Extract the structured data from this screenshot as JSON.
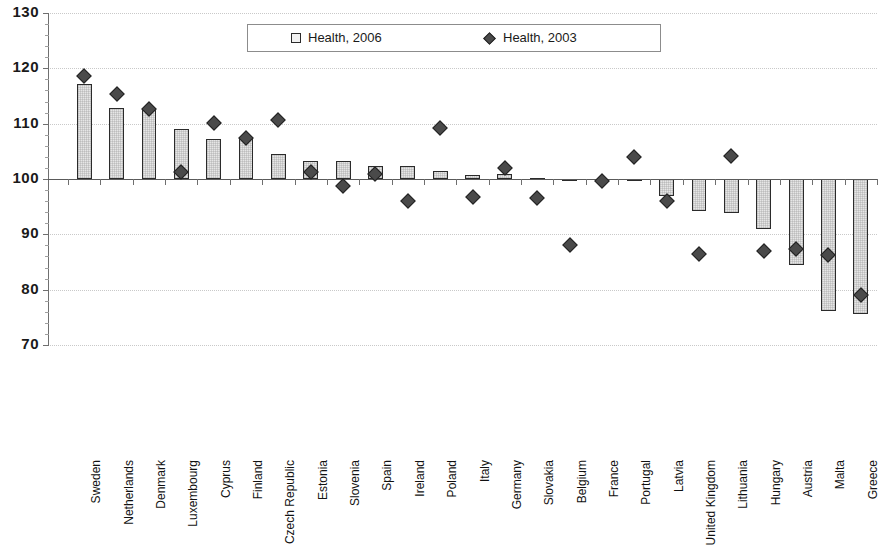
{
  "chart_data": {
    "type": "bar",
    "title": "",
    "xlabel": "",
    "ylabel": "",
    "ylim": [
      70,
      130
    ],
    "ytick_step": 10,
    "yticks": [
      70,
      80,
      90,
      100,
      110,
      120,
      130
    ],
    "grid": true,
    "baseline": 100,
    "legend_position": "top-center",
    "categories": [
      "Sweden",
      "Netherlands",
      "Denmark",
      "Luxembourg",
      "Cyprus",
      "Finland",
      "Czech Republic",
      "Estonia",
      "Slovenia",
      "Spain",
      "Ireland",
      "Poland",
      "Italy",
      "Germany",
      "Slovakia",
      "Belgium",
      "France",
      "Portugal",
      "Latvia",
      "United Kingdom",
      "Lithuania",
      "Hungary",
      "Austria",
      "Malta",
      "Greece"
    ],
    "series": [
      {
        "name": "Health, 2006",
        "marker": "square",
        "type": "bar",
        "color": "#e6e6e6",
        "edge_color": "#2b2b2b",
        "values": [
          117.2,
          112.9,
          112.4,
          109.1,
          107.3,
          107.2,
          104.6,
          103.2,
          103.3,
          102.4,
          102.3,
          101.4,
          100.8,
          100.9,
          100.2,
          99.9,
          100.0,
          99.8,
          97.0,
          94.3,
          93.8,
          91.0,
          84.5,
          76.2,
          75.6
        ]
      },
      {
        "name": "Health, 2003",
        "marker": "diamond",
        "type": "scatter",
        "color": "#4a4a4a",
        "values": [
          118.7,
          115.3,
          112.6,
          101.2,
          110.1,
          107.4,
          110.6,
          101.2,
          98.8,
          100.9,
          96.1,
          109.3,
          96.7,
          102.0,
          96.5,
          88.0,
          99.7,
          104.0,
          96.0,
          86.5,
          104.2,
          87.0,
          87.3,
          86.3,
          79.1
        ]
      }
    ],
    "legend": [
      {
        "label": "Health, 2006",
        "marker": "square"
      },
      {
        "label": "Health, 2003",
        "marker": "diamond"
      }
    ]
  }
}
